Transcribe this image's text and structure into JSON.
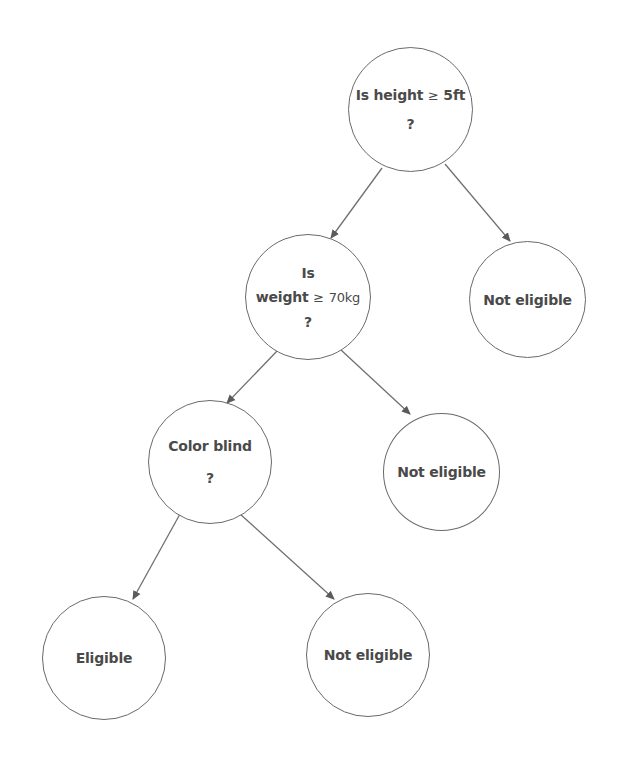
{
  "diagram": {
    "type": "decision-tree",
    "nodes": {
      "root": {
        "line1": "Is height",
        "op": "≥",
        "val": "5ft",
        "line2": "?"
      },
      "weight": {
        "line1": "Is",
        "word": "weight",
        "op": "≥",
        "val": "70kg",
        "line3": "?"
      },
      "not_eligible_right": {
        "label": "Not eligible"
      },
      "color_blind": {
        "line1": "Color blind",
        "line2": "?"
      },
      "not_eligible_mid": {
        "label": "Not eligible"
      },
      "eligible": {
        "label": "Eligible"
      },
      "not_eligible_bottom": {
        "label": "Not eligible"
      }
    },
    "edges": [
      {
        "from": "root",
        "to": "weight"
      },
      {
        "from": "root",
        "to": "not_eligible_right"
      },
      {
        "from": "weight",
        "to": "color_blind"
      },
      {
        "from": "weight",
        "to": "not_eligible_mid"
      },
      {
        "from": "color_blind",
        "to": "eligible"
      },
      {
        "from": "color_blind",
        "to": "not_eligible_bottom"
      }
    ],
    "colors": {
      "stroke": "#6a6a6a",
      "text": "#4a4a4a",
      "background": "#ffffff"
    }
  }
}
